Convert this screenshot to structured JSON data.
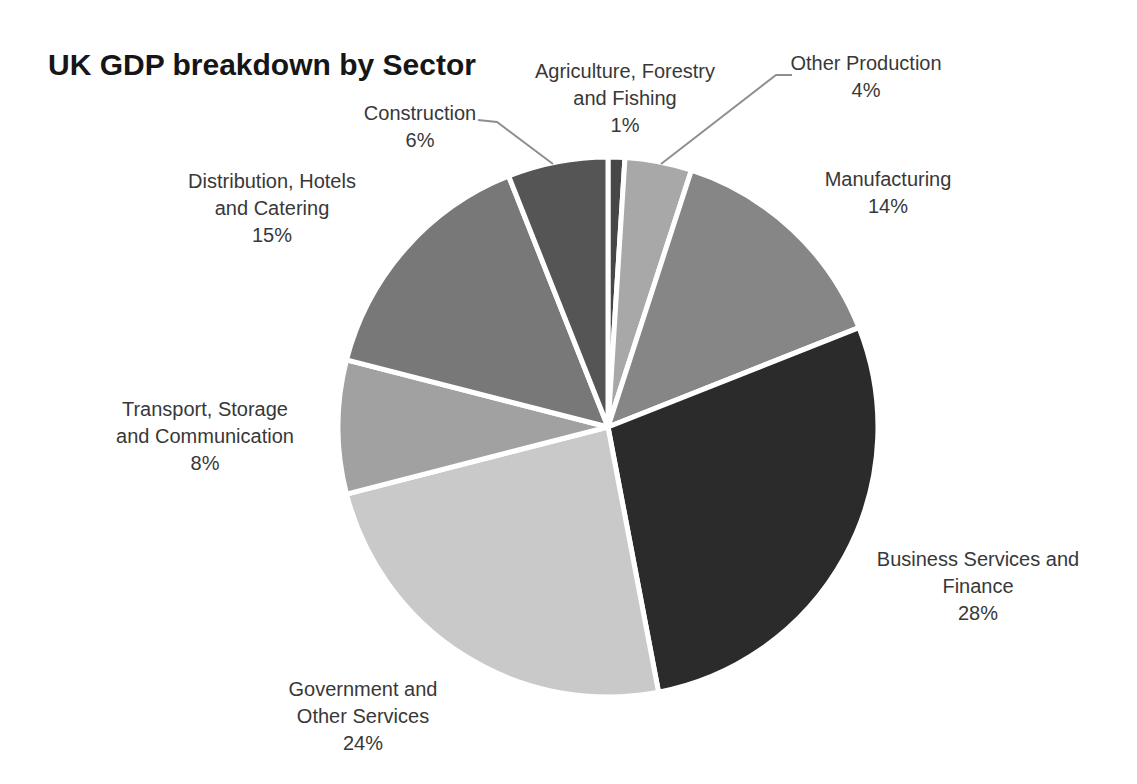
{
  "title": "UK GDP breakdown by Sector",
  "chart_data": {
    "type": "pie",
    "title": "UK GDP breakdown by Sector",
    "start_angle_deg": 0,
    "direction": "clockwise",
    "legend": "none",
    "label_style": "outside callouts with percentages",
    "palette": "grayscale",
    "slices": [
      {
        "label": "Agriculture, Forestry and Fishing",
        "label_lines": [
          "Agriculture, Forestry",
          "and Fishing"
        ],
        "pct_label": "1%",
        "value": 1,
        "color": "#474747"
      },
      {
        "label": "Other Production",
        "label_lines": [
          "Other Production"
        ],
        "pct_label": "4%",
        "value": 4,
        "color": "#a8a8a8"
      },
      {
        "label": "Manufacturing",
        "label_lines": [
          "Manufacturing"
        ],
        "pct_label": "14%",
        "value": 14,
        "color": "#868686"
      },
      {
        "label": "Business Services and Finance",
        "label_lines": [
          "Business Services and",
          "Finance"
        ],
        "pct_label": "28%",
        "value": 28,
        "color": "#2b2b2b"
      },
      {
        "label": "Government and Other Services",
        "label_lines": [
          "Government and",
          "Other Services"
        ],
        "pct_label": "24%",
        "value": 24,
        "color": "#c9c9c9"
      },
      {
        "label": "Transport, Storage and Communication",
        "label_lines": [
          "Transport, Storage",
          "and Communication"
        ],
        "pct_label": "8%",
        "value": 8,
        "color": "#a1a1a1"
      },
      {
        "label": "Distribution, Hotels and Catering",
        "label_lines": [
          "Distribution, Hotels",
          "and Catering"
        ],
        "pct_label": "15%",
        "value": 15,
        "color": "#787878"
      },
      {
        "label": "Construction",
        "label_lines": [
          "Construction"
        ],
        "pct_label": "6%",
        "value": 6,
        "color": "#555555"
      }
    ],
    "geometry": {
      "center_x": 608,
      "center_y": 427,
      "radius": 270
    }
  }
}
